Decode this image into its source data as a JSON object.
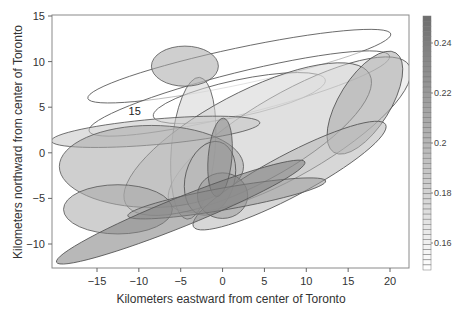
{
  "chart_data": {
    "type": "ellipse-overlay",
    "title": "",
    "xlabel": "Kilometers eastward from center of Toronto",
    "ylabel": "Kilometers northward from center of Toronto",
    "xlim": [
      -20.5,
      22.2
    ],
    "ylim": [
      -12.6,
      15.1
    ],
    "xticks": [
      -15,
      -10,
      -5,
      0,
      5,
      10,
      15,
      20
    ],
    "yticks": [
      -10,
      -5,
      0,
      5,
      10,
      15
    ],
    "xtick_labels": [
      "−15",
      "−10",
      "−5",
      "0",
      "5",
      "10",
      "15",
      "20"
    ],
    "ytick_labels": [
      "−10",
      "−5",
      "0",
      "5",
      "10",
      "15"
    ],
    "grid": false,
    "annotations": [
      {
        "text": "15",
        "x": -10.5,
        "y": 4.6
      }
    ],
    "colorbar": {
      "range": [
        0.15,
        0.25
      ],
      "ticks": [
        0.16,
        0.18,
        0.2,
        0.22,
        0.24
      ],
      "tick_labels": [
        "0.16",
        "0.18",
        "0.2",
        "0.22",
        "0.24"
      ],
      "low_color": "#ffffff",
      "high_color": "#6e6e6e",
      "position": "right"
    },
    "ellipses": [
      {
        "cx": 2,
        "cy": 9.5,
        "rx": 18.5,
        "ry": 2.0,
        "angle": 12,
        "value": 0.15
      },
      {
        "cx": 2,
        "cy": 6.5,
        "rx": 18.5,
        "ry": 2.3,
        "angle": 14,
        "value": 0.15
      },
      {
        "cx": 2,
        "cy": 6.0,
        "rx": 10.5,
        "ry": 2.0,
        "angle": 12,
        "value": 0.15
      },
      {
        "cx": 8,
        "cy": 2.0,
        "rx": 16.5,
        "ry": 4.5,
        "angle": 30,
        "value": 0.17
      },
      {
        "cx": -3.5,
        "cy": 0.5,
        "rx": 8.5,
        "ry": 2.4,
        "angle": 85,
        "value": 0.18
      },
      {
        "cx": 3,
        "cy": 1.5,
        "rx": 16.5,
        "ry": 5.0,
        "angle": 28,
        "value": 0.18
      },
      {
        "cx": -8,
        "cy": 2.3,
        "rx": 12.5,
        "ry": 1.4,
        "angle": 5,
        "value": 0.19
      },
      {
        "cx": -8.5,
        "cy": -1.5,
        "rx": 11.0,
        "ry": 4.5,
        "angle": 0,
        "value": 0.21
      },
      {
        "cx": -12.5,
        "cy": -6.2,
        "rx": 6.5,
        "ry": 2.7,
        "angle": 0,
        "value": 0.21
      },
      {
        "cx": -4.5,
        "cy": 9.5,
        "rx": 4.0,
        "ry": 2.2,
        "angle": 0,
        "value": 0.21
      },
      {
        "cx": 17,
        "cy": 5.5,
        "rx": 7.0,
        "ry": 2.8,
        "angle": 58,
        "value": 0.21
      },
      {
        "cx": -1.5,
        "cy": -2.8,
        "rx": 4.5,
        "ry": 2.7,
        "angle": 75,
        "value": 0.2
      },
      {
        "cx": 8,
        "cy": -2.5,
        "rx": 13.0,
        "ry": 2.3,
        "angle": 28,
        "value": 0.2
      },
      {
        "cx": 0,
        "cy": -4.7,
        "rx": 3.0,
        "ry": 2.5,
        "angle": 0,
        "value": 0.22
      },
      {
        "cx": -0.3,
        "cy": -0.5,
        "rx": 4.7,
        "ry": 1.3,
        "angle": 85,
        "value": 0.23
      },
      {
        "cx": 0.5,
        "cy": -5.0,
        "rx": 12.0,
        "ry": 1.2,
        "angle": 10,
        "value": 0.22
      },
      {
        "cx": -5,
        "cy": -6.5,
        "rx": 16.0,
        "ry": 1.6,
        "angle": 22,
        "value": 0.24
      }
    ]
  }
}
